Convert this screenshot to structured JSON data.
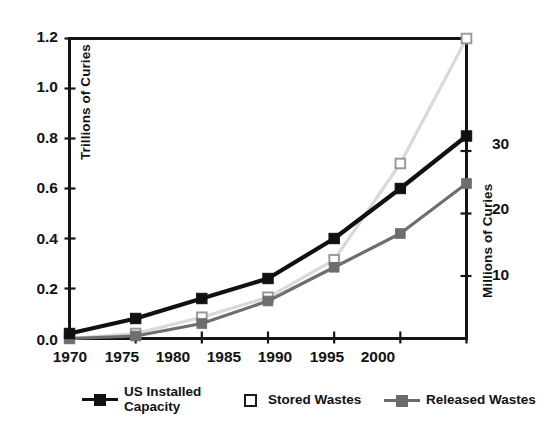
{
  "chart_data": {
    "type": "line",
    "title": "",
    "subtitle": "",
    "xlabel": "",
    "ylabel": "Trillions of Curies",
    "y2label": "Millions of Curies",
    "categories": [
      "1970",
      "1975",
      "1980",
      "1985",
      "1990",
      "1995",
      "2000"
    ],
    "x": [
      1970,
      1975,
      1980,
      1985,
      1990,
      1995,
      2000
    ],
    "xlim": [
      1970,
      2000
    ],
    "ylim": [
      0.0,
      1.2
    ],
    "y2lim": [
      0,
      48
    ],
    "yticks": [
      "0.0",
      "0.2",
      "0.4",
      "0.6",
      "0.8",
      "1.0",
      "1.2"
    ],
    "ytick_values": [
      0.0,
      0.2,
      0.4,
      0.6,
      0.8,
      1.0,
      1.2
    ],
    "y2ticks": [
      "10",
      "20",
      "30"
    ],
    "y2tick_values": [
      10,
      20,
      30
    ],
    "grid": false,
    "legend_position": "bottom",
    "series": [
      {
        "name": "US Installed Capacity",
        "axis": "left",
        "color": "#111111",
        "marker": "filled-square",
        "values": [
          0.02,
          0.08,
          0.16,
          0.24,
          0.4,
          0.6,
          0.81
        ]
      },
      {
        "name": "Stored Wastes",
        "axis": "left",
        "color": "#d9d9d9",
        "marker": "open-square",
        "values": [
          0.0,
          0.02,
          0.085,
          0.165,
          0.315,
          0.7,
          1.2
        ]
      },
      {
        "name": "Released Wastes",
        "axis": "left",
        "color": "#6e6e6e",
        "marker": "filled-square",
        "values": [
          0.0,
          0.01,
          0.06,
          0.15,
          0.285,
          0.42,
          0.62
        ]
      }
    ]
  },
  "axes": {
    "left": {
      "title": "Trillions of Curies",
      "ticks": [
        "1.2",
        "1.0",
        "0.8",
        "0.6",
        "0.4",
        "0.2",
        "0.0"
      ]
    },
    "right": {
      "title": "Millions of Curies",
      "ticks": [
        "30",
        "20",
        "10"
      ]
    },
    "bottom": {
      "ticks": [
        "1970",
        "1975",
        "1980",
        "1985",
        "1990",
        "1995",
        "2000"
      ]
    }
  },
  "legend": {
    "items": [
      {
        "label": "US Installed\nCapacity",
        "key": "black-line-square-key"
      },
      {
        "label": "Stored Wastes",
        "key": "open-square-key"
      },
      {
        "label": "Released Wastes",
        "key": "gray-line-square-key"
      }
    ]
  },
  "colors": {
    "installed_capacity": "#111111",
    "stored_wastes": "#dcdcdc",
    "released_wastes": "#6e6e6e",
    "axis": "#151515",
    "background": "#ffffff"
  }
}
